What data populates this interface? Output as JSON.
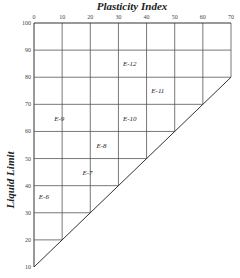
{
  "chart_data": {
    "type": "diagram-grid",
    "title": "Plasticity Index",
    "xlabel": "Plasticity Index",
    "ylabel": "Liquid Limit",
    "xlim": [
      0,
      70
    ],
    "ylim": [
      10,
      100
    ],
    "x_ticks": [
      0,
      10,
      20,
      30,
      40,
      50,
      60,
      70
    ],
    "y_ticks": [
      100,
      90,
      80,
      70,
      60,
      50,
      40,
      30,
      20,
      10
    ],
    "x_axis_position": "top",
    "grid": true,
    "boundary_line": {
      "from": {
        "pi": 0,
        "ll": 10
      },
      "to": {
        "pi": 70,
        "ll": 80
      },
      "meaning": "LL = PI + 10"
    },
    "zones": [
      {
        "label": "E-6",
        "pi": 3.5,
        "ll": 35
      },
      {
        "label": "E-7",
        "pi": 19,
        "ll": 44
      },
      {
        "label": "E-8",
        "pi": 24,
        "ll": 54
      },
      {
        "label": "E-9",
        "pi": 9,
        "ll": 64
      },
      {
        "label": "E-10",
        "pi": 34,
        "ll": 64
      },
      {
        "label": "E-11",
        "pi": 44,
        "ll": 74
      },
      {
        "label": "E-12",
        "pi": 34,
        "ll": 84
      }
    ]
  },
  "colors": {
    "line": "#333333",
    "text": "#222222",
    "background": "#ffffff"
  }
}
